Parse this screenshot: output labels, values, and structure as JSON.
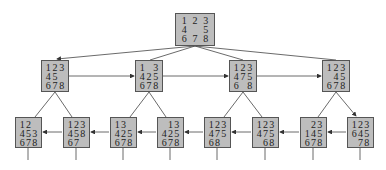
{
  "diagram": {
    "type": "8-puzzle search tree",
    "nodes": [
      {
        "id": "root",
        "x": 175,
        "y": 13,
        "w": 40,
        "h": 33,
        "cells": [
          "1",
          "2",
          "3",
          "4",
          "",
          "5",
          "6",
          "7",
          "8"
        ]
      },
      {
        "id": "a",
        "x": 41,
        "y": 60,
        "w": 28,
        "h": 32,
        "cells": [
          "1",
          "2",
          "3",
          "4",
          "5",
          "",
          "6",
          "7",
          "8"
        ]
      },
      {
        "id": "b",
        "x": 135,
        "y": 60,
        "w": 28,
        "h": 32,
        "cells": [
          "1",
          "",
          "3",
          "4",
          "2",
          "5",
          "6",
          "7",
          "8"
        ]
      },
      {
        "id": "c",
        "x": 229,
        "y": 60,
        "w": 28,
        "h": 32,
        "cells": [
          "1",
          "2",
          "3",
          "4",
          "7",
          "5",
          "6",
          "",
          "8"
        ]
      },
      {
        "id": "d",
        "x": 322,
        "y": 60,
        "w": 28,
        "h": 32,
        "cells": [
          "1",
          "2",
          "3",
          "",
          "4",
          "5",
          "6",
          "7",
          "8"
        ]
      },
      {
        "id": "a1",
        "x": 15,
        "y": 117,
        "w": 27,
        "h": 31,
        "cells": [
          "1",
          "2",
          "",
          "4",
          "5",
          "3",
          "6",
          "7",
          "8"
        ]
      },
      {
        "id": "a2",
        "x": 63,
        "y": 117,
        "w": 27,
        "h": 31,
        "cells": [
          "1",
          "2",
          "3",
          "4",
          "5",
          "8",
          "6",
          "7",
          ""
        ]
      },
      {
        "id": "b1",
        "x": 110,
        "y": 117,
        "w": 27,
        "h": 31,
        "cells": [
          "1",
          "3",
          "",
          "4",
          "2",
          "5",
          "6",
          "7",
          "8"
        ]
      },
      {
        "id": "b2",
        "x": 157,
        "y": 117,
        "w": 27,
        "h": 31,
        "cells": [
          "",
          "1",
          "3",
          "4",
          "2",
          "5",
          "6",
          "7",
          "8"
        ]
      },
      {
        "id": "c1",
        "x": 204,
        "y": 117,
        "w": 27,
        "h": 31,
        "cells": [
          "1",
          "2",
          "3",
          "4",
          "7",
          "5",
          "6",
          "8",
          ""
        ]
      },
      {
        "id": "c2",
        "x": 252,
        "y": 117,
        "w": 27,
        "h": 31,
        "cells": [
          "1",
          "2",
          "3",
          "4",
          "7",
          "5",
          "",
          "6",
          "8"
        ]
      },
      {
        "id": "d1",
        "x": 300,
        "y": 117,
        "w": 27,
        "h": 31,
        "cells": [
          "",
          "2",
          "3",
          "1",
          "4",
          "5",
          "6",
          "7",
          "8"
        ]
      },
      {
        "id": "d2",
        "x": 347,
        "y": 117,
        "w": 27,
        "h": 31,
        "cells": [
          "1",
          "2",
          "3",
          "6",
          "4",
          "5",
          "",
          "7",
          "8"
        ]
      }
    ],
    "colors": {
      "node_fill": "#bdbdbd",
      "node_border": "#555555",
      "edge": "#444444",
      "background": "#ffffff"
    }
  }
}
